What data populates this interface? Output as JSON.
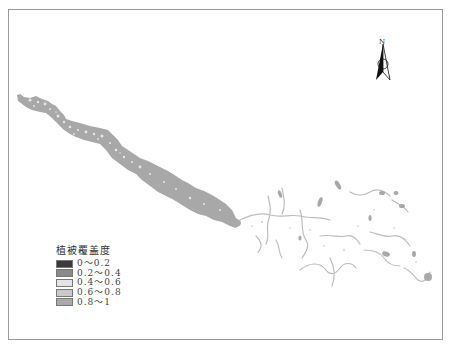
{
  "map": {
    "north_arrow": {
      "label": "N"
    },
    "legend": {
      "title": "植被覆盖度",
      "items": [
        {
          "label": "0～0.2",
          "color": "#3a3a3a"
        },
        {
          "label": "0.2～0.4",
          "color": "#8a8a8a"
        },
        {
          "label": "0.4～0.6",
          "color": "#e4e4e4"
        },
        {
          "label": "0.6～0.8",
          "color": "#c9c9c9"
        },
        {
          "label": "0.8～1",
          "color": "#a9a9a9"
        }
      ]
    },
    "colors": {
      "main_channel": "#a8a8a8",
      "tributaries": "#b0b0b0",
      "light_patches": "#e8e8e8",
      "frame": "#9a9a9a"
    }
  },
  "caption": {
    "text": ""
  }
}
